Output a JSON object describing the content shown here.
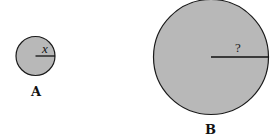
{
  "circles": [
    {
      "id": "A",
      "label": "A",
      "radius_label": "x",
      "cx": 35.5,
      "cy": 56,
      "r": 20,
      "fill": "#b8b8b8",
      "stroke": "#1a1a1a"
    },
    {
      "id": "B",
      "label": "B",
      "radius_label": "?",
      "cx": 211,
      "cy": 57,
      "r": 58,
      "fill": "#b8b8b8",
      "stroke": "#1a1a1a"
    }
  ]
}
